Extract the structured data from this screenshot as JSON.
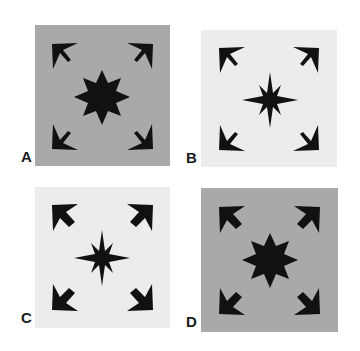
{
  "figure": {
    "colors": {
      "dark_bg": "#a9a9a9",
      "light_bg": "#ececec",
      "shape": "#111111",
      "page": "#ffffff"
    },
    "panels": [
      {
        "label": "A",
        "background": "dark",
        "star": "fat",
        "arrows": "thin"
      },
      {
        "label": "B",
        "background": "light",
        "star": "thin",
        "arrows": "thin"
      },
      {
        "label": "C",
        "background": "light",
        "star": "thin",
        "arrows": "fat"
      },
      {
        "label": "D",
        "background": "dark",
        "star": "fat",
        "arrows": "fat"
      }
    ],
    "icons": {
      "center": "eight-point-star-icon",
      "corners": [
        "arrow-up-left-icon",
        "arrow-up-right-icon",
        "arrow-down-left-icon",
        "arrow-down-right-icon"
      ]
    }
  }
}
